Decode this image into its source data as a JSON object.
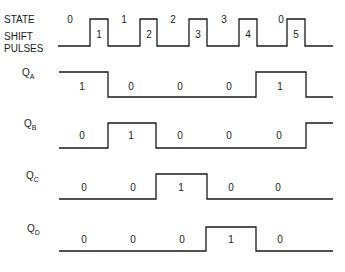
{
  "title_labels": {
    "state": "STATE",
    "shift_line1": "SHIFT",
    "shift_line2": "PULSES"
  },
  "states": [
    "0",
    "1",
    "2",
    "3",
    "0"
  ],
  "pulse_numbers": [
    "1",
    "2",
    "3",
    "4",
    "5"
  ],
  "signals": [
    {
      "name": "Q",
      "sub": "A",
      "values": [
        "1",
        "0",
        "0",
        "0",
        "1"
      ]
    },
    {
      "name": "Q",
      "sub": "B",
      "values": [
        "0",
        "1",
        "0",
        "0",
        "0"
      ]
    },
    {
      "name": "Q",
      "sub": "C",
      "values": [
        "0",
        "0",
        "1",
        "0",
        "0"
      ]
    },
    {
      "name": "Q",
      "sub": "D",
      "values": [
        "0",
        "0",
        "0",
        "1",
        "0"
      ]
    }
  ],
  "colors": {
    "ink": "#1a1a1a",
    "background": "#ffffff"
  }
}
